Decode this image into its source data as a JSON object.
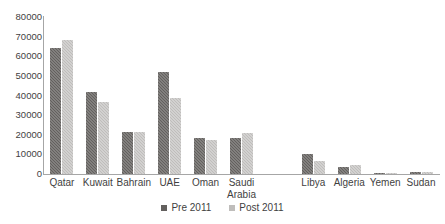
{
  "chart_data": {
    "type": "bar",
    "title": "",
    "subtitle": "",
    "xlabel": "",
    "ylabel": "",
    "ylim": [
      0,
      80000
    ],
    "ytick_labels": [
      "80000",
      "70000",
      "60000",
      "50000",
      "40000",
      "30000",
      "20000",
      "10000",
      "0"
    ],
    "ytick_values": [
      80000,
      70000,
      60000,
      50000,
      40000,
      30000,
      20000,
      10000,
      0
    ],
    "grid": false,
    "legend_position": "bottom",
    "categories": [
      "Qatar",
      "Kuwait",
      "Bahrain",
      "UAE",
      "Oman",
      "Saudi\nArabia",
      "",
      "Libya",
      "Algeria",
      "Yemen",
      "Sudan"
    ],
    "series": [
      {
        "name": "Pre 2011",
        "color": "#63605e",
        "values": [
          64000,
          42000,
          21500,
          52000,
          18500,
          18500,
          null,
          10200,
          3800,
          700,
          800
        ]
      },
      {
        "name": "Post 2011",
        "color": "#bfbdbb",
        "values": [
          68500,
          36800,
          21300,
          38500,
          17500,
          21000,
          null,
          6800,
          4400,
          500,
          1100
        ]
      }
    ]
  },
  "legend": {
    "items": [
      {
        "label": "Pre 2011"
      },
      {
        "label": "Post 2011"
      }
    ]
  }
}
